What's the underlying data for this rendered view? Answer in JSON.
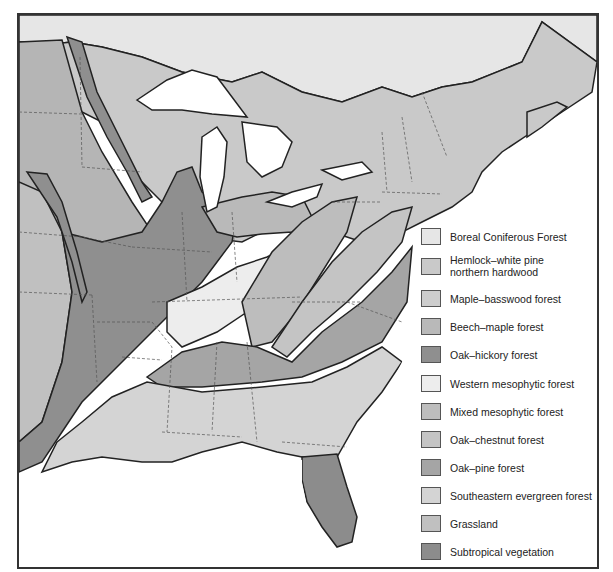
{
  "map": {
    "title": "Forest regions of eastern North America",
    "water_color": "#ffffff",
    "border_color": "#333333"
  },
  "legend": {
    "items": [
      {
        "id": "boreal",
        "label": "Boreal Coniferous Forest",
        "color": "#e6e6e6",
        "top": 0
      },
      {
        "id": "hemlock",
        "label": "Hemlock–white pine\nnorthern hardwood",
        "label_line1": "Hemlock–white pine",
        "label_line2": "northern hardwood",
        "color": "#c9c9c9",
        "top": 26
      },
      {
        "id": "maple-basswood",
        "label": "Maple–basswood forest",
        "color": "#cdcdcd",
        "top": 62
      },
      {
        "id": "beech-maple",
        "label": "Beech–maple forest",
        "color": "#b9b9b9",
        "top": 90
      },
      {
        "id": "oak-hickory",
        "label": "Oak–hickory forest",
        "color": "#8f8f8f",
        "top": 118
      },
      {
        "id": "western-mesophytic",
        "label": "Western mesophytic forest",
        "color": "#ededed",
        "top": 147
      },
      {
        "id": "mixed-mesophytic",
        "label": "Mixed mesophytic forest",
        "color": "#bdbdbd",
        "top": 175
      },
      {
        "id": "oak-chestnut",
        "label": "Oak–chestnut forest",
        "color": "#c4c4c4",
        "top": 203
      },
      {
        "id": "oak-pine",
        "label": "Oak–pine forest",
        "color": "#a5a5a5",
        "top": 231
      },
      {
        "id": "southeastern-evergreen",
        "label": "Southeastern evergreen forest",
        "color": "#d4d4d4",
        "top": 259
      },
      {
        "id": "grassland",
        "label": "Grassland",
        "color": "#c0c0c0",
        "top": 287
      },
      {
        "id": "subtropical",
        "label": "Subtropical vegetation",
        "color": "#8c8c8c",
        "top": 315
      }
    ]
  }
}
